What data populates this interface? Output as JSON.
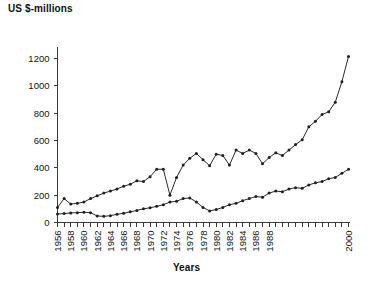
{
  "chart_data": {
    "type": "line",
    "title": "",
    "xlabel": "Years",
    "ylabel": "US $-millions",
    "ylim": [
      0,
      1300
    ],
    "xlim": [
      1956,
      2000
    ],
    "grid": false,
    "legend": "none",
    "y_ticks": [
      0,
      200,
      400,
      600,
      800,
      1000,
      1200
    ],
    "x_ticks": [
      1956,
      1958,
      1960,
      1962,
      1964,
      1966,
      1968,
      1970,
      1972,
      1974,
      1976,
      1978,
      1980,
      1982,
      1984,
      1986,
      1988,
      2000
    ],
    "x": [
      1956,
      1957,
      1958,
      1959,
      1960,
      1961,
      1962,
      1963,
      1964,
      1965,
      1966,
      1967,
      1968,
      1969,
      1970,
      1971,
      1972,
      1973,
      1974,
      1975,
      1976,
      1977,
      1978,
      1979,
      1980,
      1981,
      1982,
      1983,
      1984,
      1985,
      1986,
      1987,
      1988,
      1989,
      1990,
      1991,
      1992,
      1993,
      1994,
      1995,
      1996,
      1997,
      1998,
      1999,
      2000
    ],
    "series": [
      {
        "name": "Upper series",
        "values": [
          110,
          175,
          135,
          140,
          150,
          175,
          195,
          215,
          230,
          245,
          265,
          280,
          305,
          300,
          335,
          390,
          390,
          200,
          330,
          420,
          470,
          505,
          460,
          415,
          500,
          490,
          420,
          530,
          505,
          530,
          505,
          430,
          475,
          510,
          490,
          530,
          570,
          605,
          700,
          740,
          790,
          810,
          880,
          1030,
          1215
        ]
      },
      {
        "name": "Lower series",
        "values": [
          62,
          65,
          70,
          72,
          75,
          72,
          48,
          45,
          50,
          60,
          68,
          78,
          88,
          100,
          108,
          118,
          130,
          150,
          155,
          175,
          180,
          150,
          110,
          85,
          95,
          110,
          130,
          140,
          160,
          175,
          190,
          185,
          215,
          230,
          225,
          245,
          255,
          250,
          275,
          290,
          300,
          320,
          330,
          360,
          390
        ]
      }
    ]
  },
  "labels": {
    "y_axis_title": "US $-millions",
    "x_axis_title": "Years"
  }
}
